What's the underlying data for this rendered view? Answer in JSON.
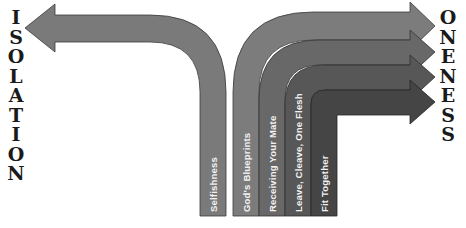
{
  "diagram": {
    "left_word": "ISOLATION",
    "left_letters": [
      "I",
      "S",
      "O",
      "L",
      "A",
      "T",
      "I",
      "O",
      "N"
    ],
    "right_word": "ONENESS",
    "right_letters": [
      "O",
      "N",
      "E",
      "N",
      "E",
      "S",
      "S"
    ],
    "arrows": [
      {
        "label": "Selfishness",
        "direction": "left",
        "color": "#7a7a7a"
      },
      {
        "label": "God's Blueprints",
        "direction": "right",
        "color": "#7c7c7c"
      },
      {
        "label": "Receiving Your Mate",
        "direction": "right",
        "color": "#686868"
      },
      {
        "label": "Leave, Cleave, One Flesh",
        "direction": "right",
        "color": "#575757"
      },
      {
        "label": "Fit Together",
        "direction": "right",
        "color": "#454545"
      }
    ]
  }
}
